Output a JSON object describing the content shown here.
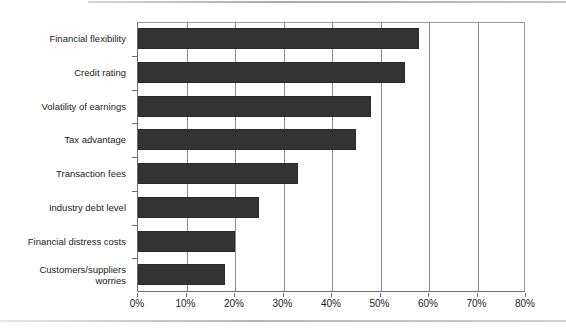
{
  "chart_data": {
    "type": "bar",
    "orientation": "horizontal",
    "title": "",
    "subtitle": "",
    "xlabel": "",
    "ylabel": "",
    "xlim": [
      0,
      80
    ],
    "ylim": null,
    "grid": true,
    "legend": null,
    "legend_position": "none",
    "xtick_labels": [
      "0%",
      "10%",
      "20%",
      "30%",
      "40%",
      "50%",
      "60%",
      "70%",
      "80%"
    ],
    "xtick_values": [
      0,
      10,
      20,
      30,
      40,
      50,
      60,
      70,
      80
    ],
    "categories": [
      "Financial flexibility",
      "Credit rating",
      "Volatility of earnings",
      "Tax advantage",
      "Transaction fees",
      "Industry debt level",
      "Financial distress costs",
      "Customers/suppliers\nworries"
    ],
    "values": [
      58,
      55,
      48,
      45,
      33,
      25,
      20,
      18
    ],
    "value_unit": "%",
    "series": [
      {
        "name": "",
        "values": [
          58,
          55,
          48,
          45,
          33,
          25,
          20,
          18
        ],
        "color": "#333333"
      }
    ]
  },
  "style": {
    "bar_color": "#333333",
    "bar_border_color": "#2b2b2b",
    "grid_color": "#8d8d8d",
    "axis_color": "#6f6f6f",
    "frame_color": "#9b9b9b",
    "background": "#ffffff",
    "text_color": "#1d1d1d"
  }
}
